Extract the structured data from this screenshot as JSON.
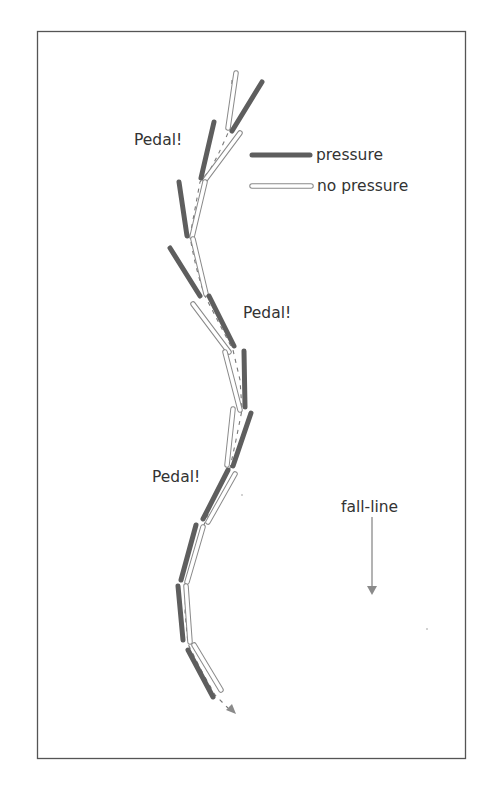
{
  "diagram": {
    "labels": {
      "pedal_1": "Pedal!",
      "pedal_2": "Pedal!",
      "pedal_3": "Pedal!",
      "fall_line": "fall-line"
    },
    "legend": {
      "pressure_label": "pressure",
      "no_pressure_label": "no pressure"
    },
    "colors": {
      "pressure": "#5e5e5e",
      "no_pressure_outline": "#8a8a8a",
      "text": "#333333",
      "frame": "#555555"
    },
    "ski_pairs": [
      {
        "pressure": [
          [
            262,
            82
          ],
          [
            232,
            131
          ]
        ],
        "no_pressure": [
          [
            236,
            73
          ],
          [
            228,
            128
          ]
        ]
      },
      {
        "pressure": [
          [
            214,
            122
          ],
          [
            201,
            178
          ]
        ],
        "no_pressure": [
          [
            240,
            133
          ],
          [
            205,
            180
          ]
        ]
      },
      {
        "pressure": [
          [
            179,
            182
          ],
          [
            187,
            236
          ]
        ],
        "no_pressure": [
          [
            205,
            182
          ],
          [
            192,
            237
          ]
        ]
      },
      {
        "pressure": [
          [
            170,
            248
          ],
          [
            200,
            296
          ]
        ],
        "no_pressure": [
          [
            193,
            239
          ],
          [
            206,
            294
          ]
        ]
      },
      {
        "pressure": [
          [
            209,
            296
          ],
          [
            234,
            346
          ]
        ],
        "no_pressure": [
          [
            193,
            304
          ],
          [
            229,
            352
          ]
        ]
      },
      {
        "pressure": [
          [
            244,
            351
          ],
          [
            245,
            407
          ]
        ],
        "no_pressure": [
          [
            225,
            352
          ],
          [
            240,
            410
          ]
        ]
      },
      {
        "pressure": [
          [
            251,
            413
          ],
          [
            233,
            466
          ]
        ],
        "no_pressure": [
          [
            233,
            409
          ],
          [
            227,
            465
          ]
        ]
      },
      {
        "pressure": [
          [
            228,
            470
          ],
          [
            203,
            519
          ]
        ],
        "no_pressure": [
          [
            235,
            474
          ],
          [
            208,
            522
          ]
        ]
      },
      {
        "pressure": [
          [
            196,
            525
          ],
          [
            181,
            580
          ]
        ],
        "no_pressure": [
          [
            203,
            527
          ],
          [
            187,
            582
          ]
        ]
      },
      {
        "pressure": [
          [
            178,
            586
          ],
          [
            183,
            640
          ]
        ],
        "no_pressure": [
          [
            186,
            586
          ],
          [
            190,
            642
          ]
        ]
      },
      {
        "pressure": [
          [
            188,
            650
          ],
          [
            213,
            697
          ]
        ],
        "no_pressure": [
          [
            194,
            645
          ],
          [
            221,
            690
          ]
        ]
      }
    ]
  }
}
